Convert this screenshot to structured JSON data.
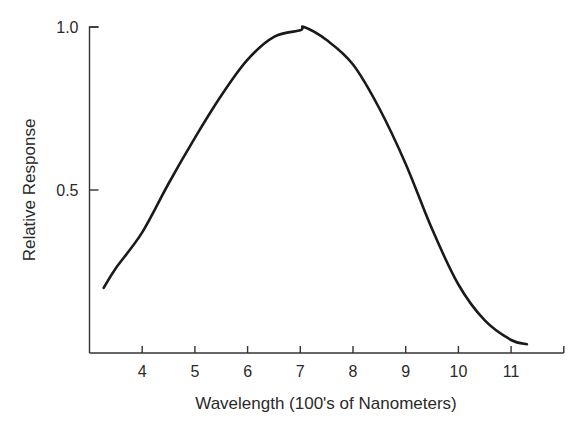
{
  "chart_data": {
    "type": "line",
    "title": "",
    "xlabel": "Wavelength (100's of Nanometers)",
    "ylabel": "Relative Response",
    "xlim": [
      3,
      12
    ],
    "ylim": [
      0,
      1.0
    ],
    "grid": false,
    "legend": null,
    "x_ticks": [
      {
        "value": 4,
        "label": "4"
      },
      {
        "value": 5,
        "label": "5"
      },
      {
        "value": 6,
        "label": "6"
      },
      {
        "value": 7,
        "label": "7"
      },
      {
        "value": 8,
        "label": "8"
      },
      {
        "value": 9,
        "label": "9"
      },
      {
        "value": 10,
        "label": "10"
      },
      {
        "value": 11,
        "label": "11"
      },
      {
        "value": 12,
        "label": ""
      }
    ],
    "y_ticks": [
      {
        "value": 0.5,
        "label": "0.5"
      },
      {
        "value": 1.0,
        "label": "1.0"
      }
    ],
    "series": [
      {
        "name": "Relative Response",
        "color": "#1a1a1a",
        "x": [
          3.27,
          3.5,
          4,
          4.5,
          5,
          5.5,
          6,
          6.5,
          7,
          7.07,
          7.5,
          8,
          8.5,
          9,
          9.5,
          10,
          10.5,
          11,
          11.3
        ],
        "values": [
          0.2,
          0.26,
          0.37,
          0.52,
          0.66,
          0.79,
          0.9,
          0.97,
          0.99,
          1.0,
          0.96,
          0.885,
          0.75,
          0.58,
          0.38,
          0.21,
          0.1,
          0.04,
          0.027
        ]
      }
    ]
  }
}
